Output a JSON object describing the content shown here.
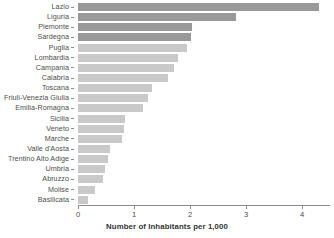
{
  "chart_data": {
    "type": "bar",
    "orientation": "horizontal",
    "title": "",
    "xlabel": "Number of Inhabitants per 1,000",
    "ylabel": "",
    "xlim": [
      0,
      4.5
    ],
    "xticks": [
      0,
      1,
      2,
      3,
      4
    ],
    "xtick_labels": [
      "0",
      "1",
      "2",
      "3",
      "4"
    ],
    "grid": false,
    "legend": false,
    "categories": [
      "Lazio",
      "Liguria",
      "Piemonte",
      "Sardegna",
      "Puglia",
      "Lombardia",
      "Campania",
      "Calabria",
      "Toscana",
      "Friuli-Venezia Giulia",
      "Emilia-Romagna",
      "Sicilia",
      "Veneto",
      "Marche",
      "Valle d'Aosta",
      "Trentino Alto Adige",
      "Umbria",
      "Abruzzo",
      "Molise",
      "Basilicata"
    ],
    "values": [
      4.3,
      2.82,
      2.03,
      2.01,
      1.95,
      1.79,
      1.71,
      1.61,
      1.32,
      1.25,
      1.16,
      0.84,
      0.82,
      0.79,
      0.57,
      0.54,
      0.49,
      0.45,
      0.3,
      0.18
    ],
    "bar_colors": [
      "#999999",
      "#999999",
      "#999999",
      "#999999",
      "#c9c9c9",
      "#c9c9c9",
      "#c9c9c9",
      "#c9c9c9",
      "#c9c9c9",
      "#c9c9c9",
      "#c9c9c9",
      "#c9c9c9",
      "#c9c9c9",
      "#c9c9c9",
      "#c9c9c9",
      "#c9c9c9",
      "#c9c9c9",
      "#c9c9c9",
      "#c9c9c9",
      "#c9c9c9"
    ],
    "colors": {
      "dark_bar": "#999999",
      "light_bar": "#c9c9c9",
      "axis": "#8c8c8c",
      "text": "#4d4d4d",
      "background": "#ffffff"
    }
  }
}
